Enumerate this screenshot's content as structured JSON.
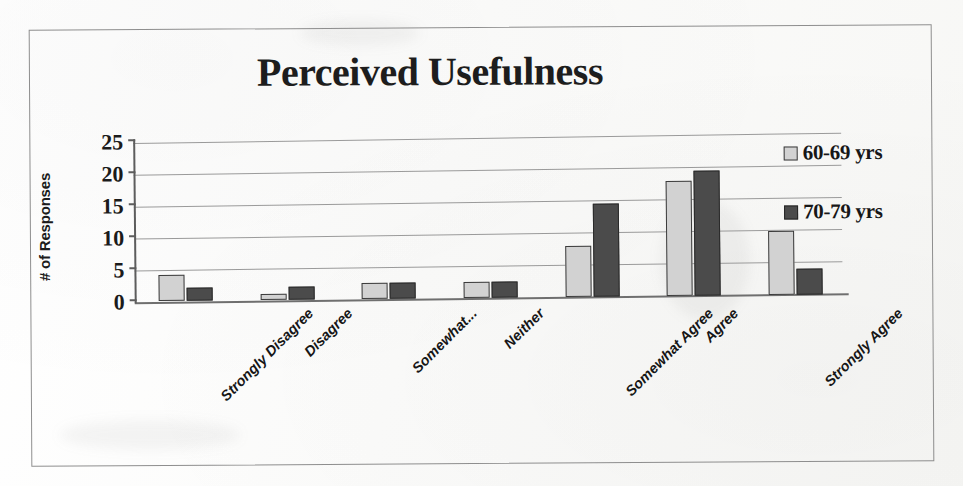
{
  "chart_data": {
    "type": "bar",
    "title": "Perceived Usefulness",
    "xlabel": "",
    "ylabel": "# of Responses",
    "ylim": [
      0,
      25
    ],
    "yticks": [
      0,
      5,
      10,
      15,
      20,
      25
    ],
    "grid": true,
    "legend_position": "right",
    "categories": [
      "Strongly Disagree",
      "Disagree",
      "Somewhat...",
      "Neither",
      "Somewhat Agree",
      "Agree",
      "Strongly Agree"
    ],
    "series": [
      {
        "name": "60-69 yrs",
        "color": "#d2d2d2",
        "values": [
          4,
          1,
          2.5,
          2.5,
          8,
          18,
          10
        ]
      },
      {
        "name": "70-79 yrs",
        "color": "#4b4b4b",
        "values": [
          2,
          2,
          2.5,
          2.5,
          14.5,
          19.5,
          4
        ]
      }
    ]
  },
  "axis": {
    "y_tick_labels": [
      "25",
      "20",
      "15",
      "10",
      "5",
      "0"
    ]
  },
  "legend": {
    "items": [
      {
        "label": "60-69 yrs"
      },
      {
        "label": "70-79 yrs"
      }
    ]
  }
}
